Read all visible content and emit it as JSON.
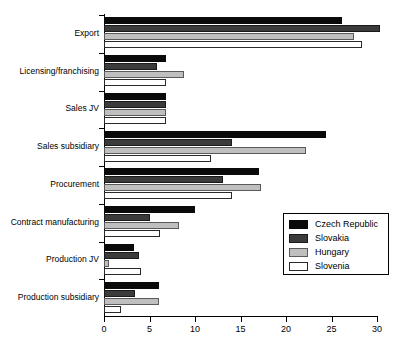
{
  "chart_data": {
    "type": "bar",
    "orientation": "horizontal",
    "title": "",
    "subtitle": "",
    "xlabel": "",
    "ylabel": "",
    "xlim": [
      0,
      30
    ],
    "xticks": [
      0,
      5,
      10,
      15,
      20,
      25,
      30
    ],
    "xticklabels": [
      "0",
      "5",
      "10",
      "15",
      "20",
      "25",
      "30"
    ],
    "grid": false,
    "legend_position": "center-right",
    "categories": [
      "Export",
      "Licensing/franchising",
      "Sales JV",
      "Sales subsidiary",
      "Procurement",
      "Contract manufacturing",
      "Production JV",
      "Production subsidiary"
    ],
    "series": [
      {
        "name": "Czech Republic",
        "color": "#0a0a0a",
        "values": [
          26.2,
          6.8,
          6.8,
          24.4,
          17.0,
          10.0,
          3.3,
          6.0
        ]
      },
      {
        "name": "Slovakia",
        "color": "#3b3b3b",
        "values": [
          30.3,
          5.8,
          6.8,
          14.1,
          13.1,
          5.0,
          3.9,
          3.4
        ]
      },
      {
        "name": "Hungary",
        "color": "#bfbfbf",
        "values": [
          27.5,
          8.8,
          6.8,
          22.2,
          17.3,
          8.2,
          0.5,
          6.0
        ]
      },
      {
        "name": "Slovenia",
        "color": "#ffffff",
        "values": [
          28.3,
          6.8,
          6.8,
          11.8,
          14.1,
          6.2,
          4.1,
          1.9
        ]
      }
    ]
  }
}
